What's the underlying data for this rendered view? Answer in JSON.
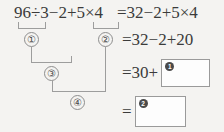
{
  "problem": {
    "expression_left": "96÷3−2+5×4",
    "expression_right": "=32−2+5×4"
  },
  "steps": [
    {
      "id": "step2",
      "text": "=32−2+20"
    },
    {
      "id": "step3",
      "text": "=30+"
    },
    {
      "id": "step4",
      "text": "="
    }
  ],
  "answer_boxes": [
    {
      "badge": "1",
      "value": ""
    },
    {
      "badge": "2",
      "value": ""
    }
  ],
  "order_labels": [
    {
      "label": "①",
      "name": "order-label-1"
    },
    {
      "label": "②",
      "name": "order-label-2"
    },
    {
      "label": "③",
      "name": "order-label-3"
    },
    {
      "label": "④",
      "name": "order-label-4"
    }
  ],
  "colors": {
    "background": "#f4f3f1",
    "text": "#3b3b3b",
    "rule": "#9d9d9d",
    "box_border": "#9a9a9a",
    "badge_fill": "#4a4a4a"
  }
}
